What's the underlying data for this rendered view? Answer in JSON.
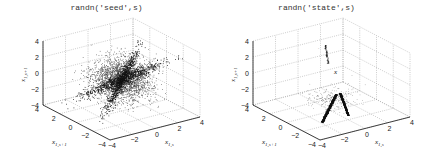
{
  "figure": {
    "panels": [
      {
        "title": "randn('seed',s)"
      },
      {
        "title": "randn('state',s)"
      }
    ]
  },
  "axes_labels": {
    "z": "x1,s+1",
    "y": "x1,s+1",
    "x": "x1,s",
    "ticks": [
      "-4",
      "-2",
      "0",
      "2",
      "4"
    ]
  },
  "chart_data": [
    {
      "type": "scatter",
      "title": "randn('seed',s)",
      "dimensions": 3,
      "xlabel": "x_{1,s}",
      "ylabel": "x_{1,s+1}",
      "zlabel": "x_{1,s+1}",
      "xlim": [
        -4,
        4
      ],
      "ylim": [
        -4,
        4
      ],
      "zlim": [
        -4,
        4
      ],
      "ticks": [
        -4,
        -2,
        0,
        2,
        4
      ],
      "grid": true,
      "description": "Dense cloud of points centered at origin with a dark bow-tie / X-shaped concentrated structure (correlated successive samples)."
    },
    {
      "type": "scatter",
      "title": "randn('state',s)",
      "dimensions": 3,
      "xlabel": "x_{1,s}",
      "ylabel": "x_{1,s+1}",
      "zlabel": "x_{1,s+1}",
      "xlim": [
        -4,
        4
      ],
      "ylim": [
        -4,
        4
      ],
      "zlim": [
        -4,
        4
      ],
      "ticks": [
        -4,
        -2,
        0,
        2,
        4
      ],
      "grid": true,
      "description": "Points concentrated on two dark narrow streaks near the bottom center plus a small vertical streak near the top; sparse elsewhere."
    }
  ]
}
